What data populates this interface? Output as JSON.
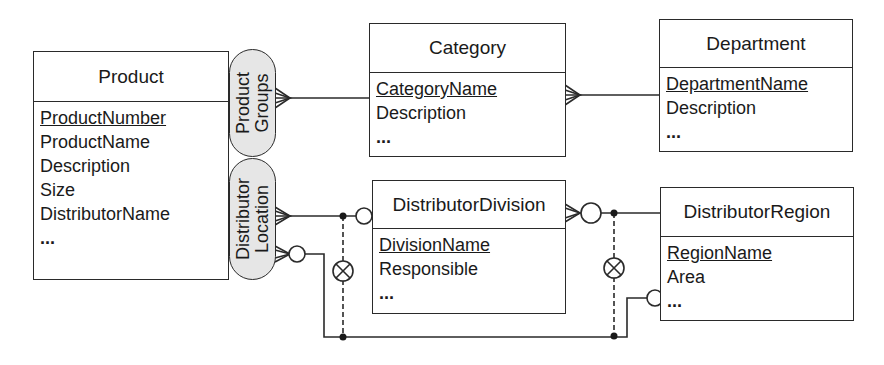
{
  "entities": {
    "product": {
      "title": "Product",
      "attributes": [
        "ProductNumber",
        "ProductName",
        "Description",
        "Size",
        "DistributorName",
        "..."
      ],
      "primary_key": "ProductNumber"
    },
    "category": {
      "title": "Category",
      "attributes": [
        "CategoryName",
        "Description",
        "..."
      ],
      "primary_key": "CategoryName"
    },
    "department": {
      "title": "Department",
      "attributes": [
        "DepartmentName",
        "Description",
        "..."
      ],
      "primary_key": "DepartmentName"
    },
    "distributor_division": {
      "title": "DistributorDivision",
      "attributes": [
        "DivisionName",
        "Responsible",
        "..."
      ],
      "primary_key": "DivisionName"
    },
    "distributor_region": {
      "title": "DistributorRegion",
      "attributes": [
        "RegionName",
        "Area",
        "..."
      ],
      "primary_key": "RegionName"
    }
  },
  "relationship_groups": {
    "product_groups": {
      "line1": "Product",
      "line2": "Groups"
    },
    "distributor_location": {
      "line1": "Distributor",
      "line2": "Location"
    }
  },
  "colors": {
    "line": "#2a2a2a",
    "pill_fill": "#e6e6e6",
    "box_fill": "#ffffff"
  }
}
